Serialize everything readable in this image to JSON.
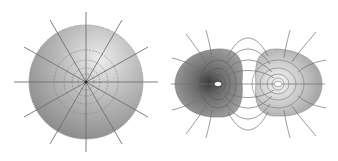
{
  "figure": {
    "panels": [
      {
        "name": "point-charge-field",
        "description": "Shaded sphere with radial field lines and concentric dashed equipotential circles",
        "field_lines": 12,
        "equipotentials": 4
      },
      {
        "name": "electric-dipole-field",
        "description": "Two opposite charges with shaded equipotential lobes and curved field lines connecting them",
        "left_charge": "dark",
        "right_charge": "light"
      }
    ]
  },
  "colors": {
    "background": "#ffffff",
    "sphere_light": "#e6e6e6",
    "sphere_dark": "#8c8c8c",
    "line": "#6e6e6e",
    "lobe_dark": "#7a7a7a",
    "lobe_light": "#c8c8c8"
  }
}
